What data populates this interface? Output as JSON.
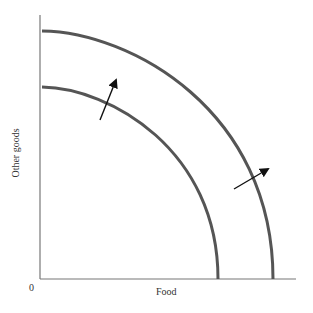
{
  "diagram": {
    "axes": {
      "x_label": "Food",
      "y_label": "Other goods",
      "origin_label": "0"
    },
    "curves": [
      {
        "name": "initial-ppf",
        "y_intercept_px": 87,
        "x_intercept_px": 218
      },
      {
        "name": "shifted-ppf",
        "y_intercept_px": 31,
        "x_intercept_px": 273
      }
    ],
    "arrows": [
      {
        "name": "shift-arrow-upper",
        "from": [
          100,
          120
        ],
        "to": [
          117,
          78
        ]
      },
      {
        "name": "shift-arrow-lower",
        "from": [
          234,
          189
        ],
        "to": [
          270,
          168
        ]
      }
    ],
    "colors": {
      "curve": "#555555",
      "axis": "#777777",
      "arrow": "#111111",
      "text": "#333333"
    }
  }
}
